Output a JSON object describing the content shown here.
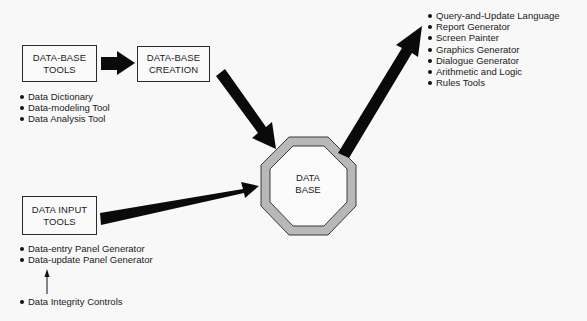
{
  "nodes": {
    "database_tools": {
      "line1": "DATA-BASE",
      "line2": "TOOLS"
    },
    "database_creation": {
      "line1": "DATA-BASE",
      "line2": "CREATION"
    },
    "data_input_tools": {
      "line1": "DATA INPUT",
      "line2": "TOOLS"
    },
    "database": {
      "line1": "DATA",
      "line2": "BASE"
    }
  },
  "lists": {
    "database_tools_items": [
      "Data Dictionary",
      "Data-modeling Tool",
      "Data Analysis Tool"
    ],
    "data_input_items": [
      "Data-entry Panel Generator",
      "Data-update Panel Generator"
    ],
    "integrity_item": "Data Integrity Controls",
    "output_items": [
      "Query-and-Update Language",
      "Report Generator",
      "Screen Painter",
      "Graphics Generator",
      "Dialogue Generator",
      "Arithmetic and Logic",
      "Rules Tools"
    ]
  },
  "edges": [
    {
      "from": "database_tools",
      "to": "database_creation"
    },
    {
      "from": "database_creation",
      "to": "database"
    },
    {
      "from": "data_input_tools",
      "to": "database"
    },
    {
      "from": "database",
      "to": "output_items"
    },
    {
      "from": "integrity_item",
      "to": "data_input_items"
    }
  ],
  "colors": {
    "background": "#f8f8f8",
    "arrow": "#0a0a0a",
    "octagon_ring": "#b8b8b8",
    "octagon_outline": "#3a3a3a"
  }
}
